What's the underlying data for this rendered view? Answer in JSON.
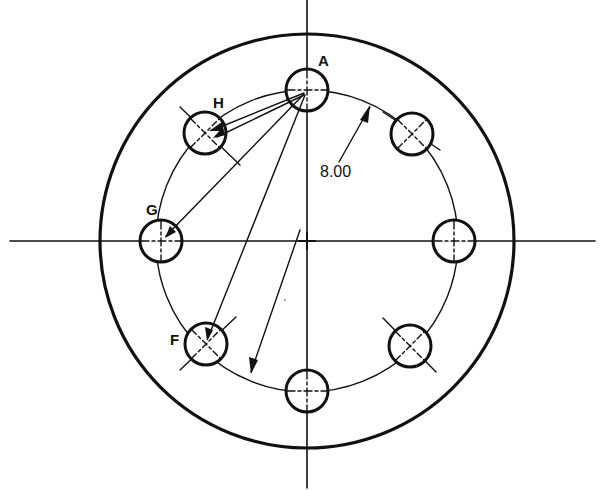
{
  "diagram": {
    "type": "bolt-circle-layout",
    "ink_color": "#111111",
    "background": "#ffffff",
    "center": {
      "x": 307,
      "y": 241
    },
    "outer_circle_radius": 207,
    "bolt_circle_radius": 151,
    "hole_radius": 21,
    "hole_count": 8,
    "dimension": {
      "label": "8.00",
      "description": "bolt circle diameter"
    },
    "hole_labels": [
      {
        "id": "A",
        "angle_deg": 90
      },
      {
        "id": "H",
        "angle_deg": 135
      },
      {
        "id": "G",
        "angle_deg": 180
      },
      {
        "id": "F",
        "angle_deg": 225
      }
    ],
    "unlabeled_holes_angles_deg": [
      45,
      0,
      315,
      270
    ],
    "construction_lines": "chords drawn from A to H, G and F with arrowheads"
  }
}
